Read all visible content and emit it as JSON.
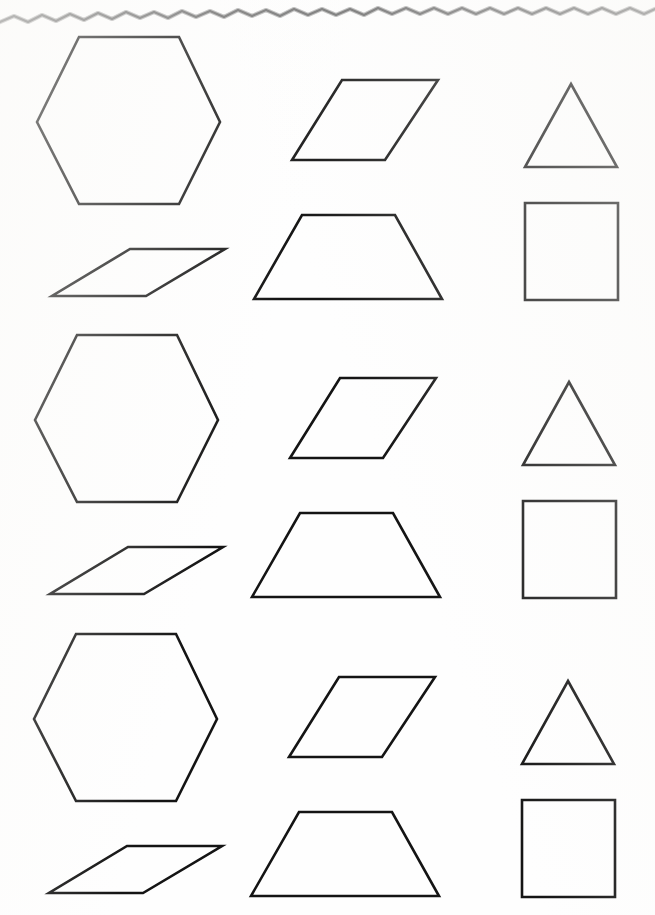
{
  "document": {
    "kind": "scanned-worksheet-page",
    "paper_color": "#fefefe",
    "ink_color": "#141414",
    "width": 655,
    "height": 915,
    "torn_top_edge": true,
    "torn_edge_color": "#6d6d6d",
    "stroke_width": 2.6,
    "row_count": 3,
    "shapes_per_row": 6,
    "row_offsets_y": [
      0,
      298,
      597
    ]
  },
  "shape_catalog": [
    {
      "id": "hexagon",
      "name": "hexagon",
      "sides": 6,
      "column": "left",
      "slot": "top",
      "points": "37,122 79,37 179,37 220,122 179,204 79,204"
    },
    {
      "id": "parallelogram-flat",
      "name": "flat parallelogram",
      "sides": 4,
      "column": "left",
      "slot": "bottom",
      "points": "130,249 225,249 146,296 52,296"
    },
    {
      "id": "parallelogram-steep",
      "name": "steep parallelogram",
      "sides": 4,
      "column": "center",
      "slot": "top",
      "points": "342,80 438,80 385,160 292,160"
    },
    {
      "id": "trapezoid",
      "name": "trapezoid",
      "sides": 4,
      "column": "center",
      "slot": "bottom",
      "points": "302,215 395,215 442,299 254,299"
    },
    {
      "id": "triangle",
      "name": "triangle",
      "sides": 3,
      "column": "right",
      "slot": "top",
      "points": "571,84 617,167 525,167"
    },
    {
      "id": "square",
      "name": "square",
      "sides": 4,
      "column": "right",
      "slot": "bottom",
      "points": "525,203 618,203 618,300 525,300"
    }
  ],
  "rows": [
    {
      "index": 1,
      "label": "row-1",
      "offset_y": 0,
      "shapes": [
        "hexagon",
        "parallelogram-flat",
        "parallelogram-steep",
        "trapezoid",
        "triangle",
        "square"
      ]
    },
    {
      "index": 2,
      "label": "row-2",
      "offset_y": 298,
      "shapes": [
        "hexagon",
        "parallelogram-flat",
        "parallelogram-steep",
        "trapezoid",
        "triangle",
        "square"
      ]
    },
    {
      "index": 3,
      "label": "row-3",
      "offset_y": 597,
      "shapes": [
        "hexagon",
        "parallelogram-flat",
        "parallelogram-steep",
        "trapezoid",
        "triangle",
        "square"
      ]
    }
  ],
  "torn_edge": {
    "name": "torn-paper-top-edge",
    "path": "M0,22 L14,16 L28,22 L42,15 L56,21 L70,14 L84,20 L98,13 L112,19 L126,12 L140,18 L154,12 L168,18 L182,11 L196,17 L210,11 L224,17 L238,10 L252,16 L266,10 L280,16 L294,9 L308,15 L322,9 L336,15 L350,9 L364,15 L378,8 L392,14 L406,8 L420,14 L434,8 L448,14 L462,8 L476,14 L490,8 L504,14 L518,8 L532,14 L546,8 L560,14 L574,8 L588,14 L602,8 L616,14 L630,8 L644,14 L655,9"
  }
}
